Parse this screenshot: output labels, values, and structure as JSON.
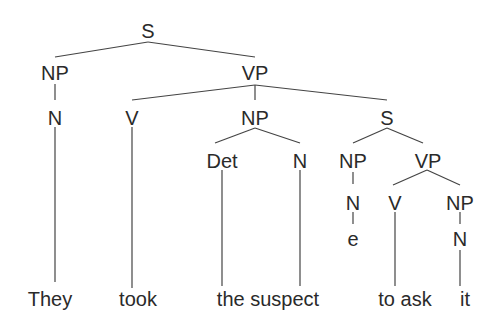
{
  "diagram": {
    "type": "syntax-tree",
    "nodes": {
      "s_root": "S",
      "np_subj": "NP",
      "n_subj": "N",
      "vp_main": "VP",
      "v_main": "V",
      "np_obj": "NP",
      "det": "Det",
      "n_obj": "N",
      "s_emb": "S",
      "np_emb": "NP",
      "n_emb": "N",
      "empty": "e",
      "vp_emb": "VP",
      "v_emb": "V",
      "np_emb_obj": "NP",
      "n_emb_obj": "N"
    },
    "words": {
      "w1": "They",
      "w2": "took",
      "w3": "the suspect",
      "w4": "to ask",
      "w5": "it"
    },
    "colors": {
      "text": "#2a2a2a",
      "line": "#444444",
      "background": "#ffffff"
    }
  }
}
